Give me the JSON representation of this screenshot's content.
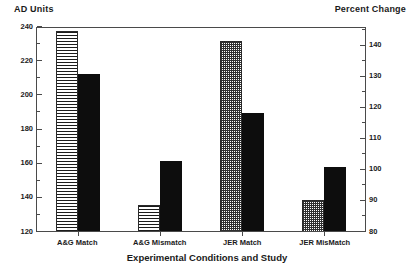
{
  "chart_data": {
    "type": "bar",
    "title": "",
    "xlabel": "Experimental Conditions and Study",
    "categories": [
      "A&G Match",
      "A&G Mismatch",
      "JER Match",
      "JER MisMatch"
    ],
    "grid": false,
    "legend_position": "none",
    "left_axis": {
      "label": "AD Units",
      "ylim": [
        120,
        240
      ],
      "ticks": [
        120,
        140,
        160,
        180,
        200,
        220,
        240
      ],
      "minor_ticks": [
        130,
        150,
        170,
        190,
        210,
        230
      ]
    },
    "right_axis": {
      "label": "Percent Change",
      "ylim": [
        80,
        146
      ],
      "ticks": [
        80,
        90,
        100,
        110,
        120,
        130,
        140
      ],
      "minor_ticks": [
        85,
        95,
        105,
        115,
        125,
        135,
        145
      ]
    },
    "series": [
      {
        "name": "Study measure (patterned)",
        "pattern": "hatch-lines-and-dots",
        "values": [
          237,
          135,
          231,
          90
        ],
        "axis": [
          "left",
          "left",
          "left",
          "right"
        ]
      },
      {
        "name": "Comparison measure (solid black)",
        "pattern": "solid",
        "values": [
          212,
          161,
          189,
          100.5
        ],
        "axis": [
          "left",
          "left",
          "left",
          "right"
        ]
      }
    ],
    "bar_groups": [
      {
        "category": "A&G Match",
        "bars": [
          {
            "pattern": "hatch-lines",
            "value": 237,
            "axis": "left"
          },
          {
            "pattern": "solid",
            "value": 212,
            "axis": "left"
          }
        ]
      },
      {
        "category": "A&G Mismatch",
        "bars": [
          {
            "pattern": "hatch-lines",
            "value": 135,
            "axis": "left"
          },
          {
            "pattern": "solid",
            "value": 161,
            "axis": "left"
          }
        ]
      },
      {
        "category": "JER Match",
        "bars": [
          {
            "pattern": "hatch-dots",
            "value": 231,
            "axis": "left"
          },
          {
            "pattern": "solid",
            "value": 189,
            "axis": "left"
          }
        ]
      },
      {
        "category": "JER MisMatch",
        "bars": [
          {
            "pattern": "hatch-dots",
            "value": 90,
            "axis": "right"
          },
          {
            "pattern": "solid",
            "value": 100.5,
            "axis": "right"
          }
        ]
      }
    ],
    "colors": {
      "solid_bar": "#0d0d0d",
      "pattern_stroke": "#1c1c1c",
      "axis": "#4a4a4a",
      "background": "#ffffff",
      "text": "#1a1a1a"
    }
  }
}
